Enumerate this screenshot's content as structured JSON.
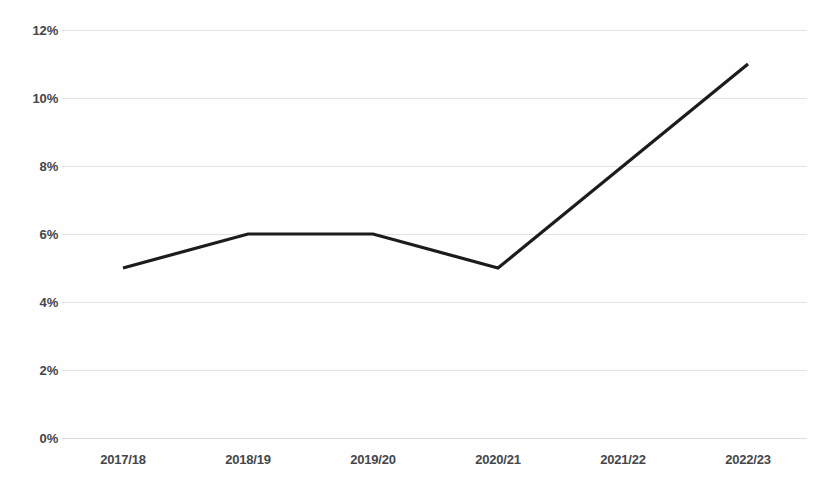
{
  "chart_data": {
    "type": "line",
    "title": "",
    "subtitle": "",
    "xlabel": "",
    "ylabel": "",
    "categories": [
      "2017/18",
      "2018/19",
      "2019/20",
      "2020/21",
      "2021/22",
      "2022/23"
    ],
    "series": [
      {
        "name": "",
        "values": [
          5,
          6,
          6,
          5,
          8,
          11
        ]
      }
    ],
    "value_suffix": "%",
    "ylim": [
      0,
      12
    ],
    "ytick_step": 2,
    "ytick_labels": [
      "0%",
      "2%",
      "4%",
      "6%",
      "8%",
      "10%",
      "12%"
    ],
    "ytick_values": [
      0,
      2,
      4,
      6,
      8,
      10,
      12
    ],
    "grid": true,
    "grid_axis": "y",
    "legend": false,
    "legend_position": "none",
    "colors": {
      "line": "#1c1c1c",
      "grid": "#e3e3e6",
      "text": "#44464a",
      "background": "#fefefe"
    },
    "annotations": []
  }
}
